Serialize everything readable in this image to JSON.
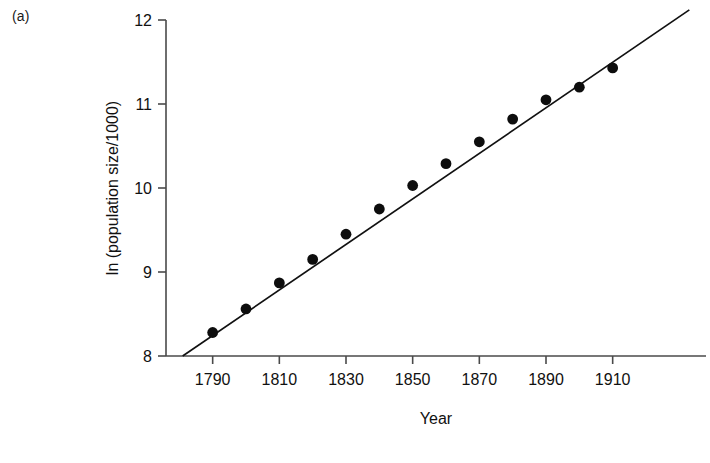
{
  "figure": {
    "panel_label": "(a)"
  },
  "chart_data": {
    "type": "scatter",
    "title": "",
    "xlabel": "Year",
    "ylabel": "ln (population size/1000)",
    "x": [
      1790,
      1800,
      1810,
      1820,
      1830,
      1840,
      1850,
      1860,
      1870,
      1880,
      1890,
      1900,
      1910
    ],
    "values": [
      8.28,
      8.56,
      8.87,
      9.15,
      9.45,
      9.75,
      10.03,
      10.29,
      10.55,
      10.82,
      11.05,
      11.2,
      11.43
    ],
    "series": [
      {
        "name": "ln (population size/1000)",
        "values": [
          8.28,
          8.56,
          8.87,
          9.15,
          9.45,
          9.75,
          10.03,
          10.29,
          10.55,
          10.82,
          11.05,
          11.2,
          11.43
        ]
      }
    ],
    "fit_line": {
      "type": "linear",
      "x_start": 1781,
      "x_end": 1933,
      "y_start": 8.0,
      "y_end": 12.12
    },
    "xticks": [
      1790,
      1810,
      1830,
      1850,
      1870,
      1890,
      1910
    ],
    "xtick_labels": [
      "1790",
      "1810",
      "1830",
      "1850",
      "1870",
      "1890",
      "1910"
    ],
    "yticks": [
      8,
      9,
      10,
      11,
      12
    ],
    "ytick_labels": [
      "8",
      "9",
      "10",
      "11",
      "12"
    ],
    "xlim": [
      1776,
      1938
    ],
    "ylim": [
      8,
      12
    ],
    "grid": false,
    "legend": null,
    "marker": "filled-circle",
    "marker_color": "#0d0d0d",
    "line_color": "#111111"
  }
}
